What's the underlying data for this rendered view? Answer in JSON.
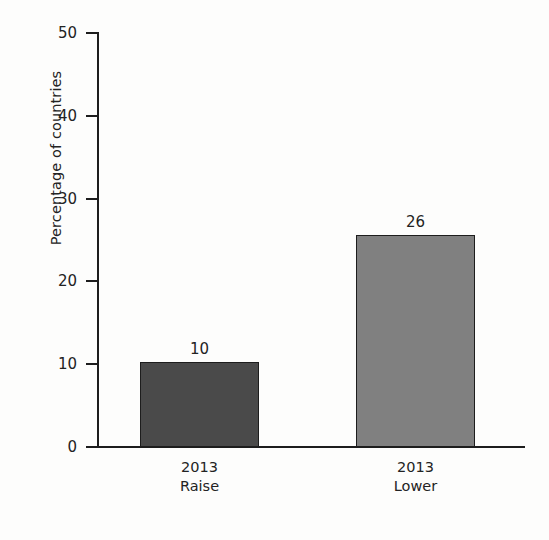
{
  "chart_data": {
    "type": "bar",
    "title": "",
    "subtitle": "",
    "xlabel": "",
    "ylabel": "Percentage of countries",
    "categories": [
      "2013\nRaise",
      "2013\nLower"
    ],
    "category_lines": [
      {
        "line1": "2013",
        "line2": "Raise"
      },
      {
        "line1": "2013",
        "line2": "Lower"
      }
    ],
    "values": [
      10,
      26
    ],
    "plotted_values": [
      10.3,
      25.6
    ],
    "data_labels": [
      "10",
      "26"
    ],
    "bar_colors": [
      "#4a4a4a",
      "#808080"
    ],
    "bar_edge_color": "#1d1d1d",
    "ylim": [
      0,
      50
    ],
    "yticks": [
      0,
      10,
      20,
      30,
      40,
      50
    ],
    "ytick_labels": [
      "0",
      "10",
      "20",
      "30",
      "40",
      "50"
    ],
    "grid": false,
    "legend": null,
    "legend_position": "none",
    "annotations": []
  },
  "style": {
    "background": "#fdfdfc",
    "axis_color": "#1d1d1d",
    "text_color": "#232323"
  }
}
